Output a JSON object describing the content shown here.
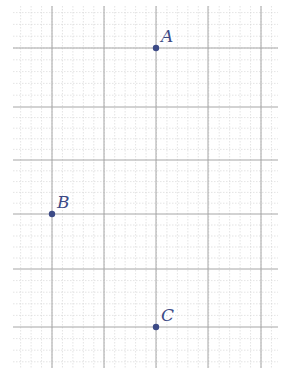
{
  "canvas": {
    "width": 283,
    "height": 374,
    "background": "#ffffff"
  },
  "grid": {
    "x_start": 13,
    "x_end": 278,
    "y_start": 6,
    "y_end": 368,
    "minor_color": "#d2d2d2",
    "major_color": "#a6a6a6",
    "major_x": [
      52,
      104,
      156,
      208,
      261
    ],
    "major_y": [
      48,
      107,
      160,
      214,
      269,
      327
    ],
    "minor_per_major": 5
  },
  "point_color": "#3c4a86",
  "points": [
    {
      "label": "A",
      "x": 156,
      "y": 48
    },
    {
      "label": "B",
      "x": 52,
      "y": 214
    },
    {
      "label": "C",
      "x": 156,
      "y": 327
    }
  ]
}
